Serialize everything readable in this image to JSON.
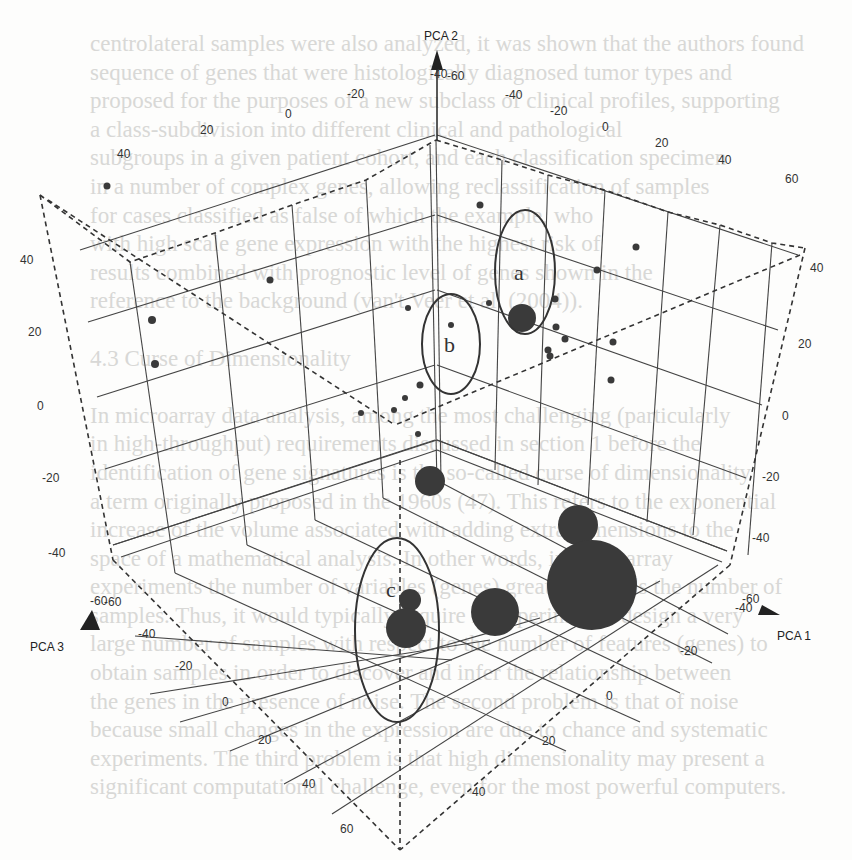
{
  "figure": {
    "type": "3d-scatter-pca",
    "axes": {
      "x": {
        "label": "PCA 1",
        "ticks_front": [
          "-40",
          "-20",
          "0",
          "20",
          "40"
        ],
        "ticks_right": [
          "60",
          "40",
          "20",
          "0",
          "-20",
          "-40",
          "-60"
        ]
      },
      "y": {
        "label": "PCA 2",
        "ticks_left": [
          "40",
          "20",
          "0",
          "-20",
          "-40",
          "-60"
        ],
        "ticks_right": [
          "40",
          "20",
          "0",
          "-20",
          "-40",
          "-60"
        ]
      },
      "z": {
        "label": "PCA 3",
        "ticks_front": [
          "-60",
          "-40",
          "-20",
          "0",
          "20",
          "40",
          "60"
        ],
        "ticks_top_left": [
          "40",
          "20",
          "0",
          "-20",
          "-40"
        ],
        "ticks_top_right": [
          "-60",
          "-40",
          "-20",
          "0",
          "20",
          "40",
          "60"
        ]
      }
    },
    "cluster_labels": [
      "a",
      "b",
      "c"
    ]
  },
  "chart_data": {
    "type": "scatter",
    "subtype": "3d",
    "title": "",
    "xlabel": "PCA 1",
    "ylabel": "PCA 2",
    "zlabel": "PCA 3",
    "xlim": [
      -40,
      60
    ],
    "ylim": [
      -60,
      40
    ],
    "zlim": [
      -60,
      60
    ],
    "grid": true,
    "legend": null,
    "annotations": [
      {
        "label": "a",
        "description": "ellipse around one large point and nearby small points (upper middle-right)"
      },
      {
        "label": "b",
        "description": "ellipse around small points near the back vertical edge"
      },
      {
        "label": "c",
        "description": "ellipse around a pair of medium spheres on the floor (lower left)"
      }
    ],
    "series": [
      {
        "name": "small points (samples)",
        "marker": "small sphere",
        "approx_screen_points": [
          [
            107,
            186
          ],
          [
            270,
            280
          ],
          [
            152,
            320
          ],
          [
            155,
            364
          ],
          [
            480,
            205
          ],
          [
            636,
            247
          ],
          [
            597,
            270
          ],
          [
            555,
            299
          ],
          [
            408,
            308
          ],
          [
            451,
            325
          ],
          [
            473,
            321
          ],
          [
            484,
            330
          ],
          [
            501,
            330
          ],
          [
            522,
            340
          ],
          [
            556,
            342
          ],
          [
            564,
            344
          ],
          [
            548,
            378
          ],
          [
            613,
            385
          ],
          [
            619,
            405
          ],
          [
            613,
            398
          ],
          [
            361,
            413
          ],
          [
            395,
            410
          ],
          [
            395,
            430
          ],
          [
            417,
            420
          ],
          [
            362,
            433
          ]
        ]
      },
      {
        "name": "large spheres",
        "marker": "large sphere (size ~ group weight)",
        "approx_screen_points": [
          {
            "x": 522,
            "y": 318,
            "r": 14,
            "cluster": "a"
          },
          {
            "x": 430,
            "y": 481,
            "r": 15
          },
          {
            "x": 578,
            "y": 525,
            "r": 21
          },
          {
            "x": 592,
            "y": 580,
            "r": 46
          },
          {
            "x": 495,
            "y": 612,
            "r": 24
          },
          {
            "x": 410,
            "y": 597,
            "r": 10,
            "cluster": "c"
          },
          {
            "x": 380,
            "y": 628,
            "r": 20,
            "cluster": "c"
          }
        ]
      }
    ]
  },
  "background_text": {
    "lines": [
      "centrolateral samples were also analyzed, it was shown that the authors found",
      "sequence of genes that were histologically diagnosed tumor types and",
      "proposed for the purposes of a new subclass of clinical profiles, supporting",
      "a class-subdivision into different clinical and pathological",
      "subgroups in a given patient cohort, and each classification specimen",
      "in a number of complex genes, allowing reclassification of samples",
      "for cases classified as false of which the example, who",
      "with high scale gene expression with the highest risk of",
      "results combined with prognostic level of genes shown in the",
      "reference to the background (van't Veer et al. (2004)).",
      "",
      "4.3 Curse of Dimensionality",
      "",
      "In microarray data analysis, among the most challenging (particularly",
      "in high-throughput) requirements discussed in section 1 before the",
      "identification of gene signatures is the so-called curse of dimensionality",
      "a term originally proposed in the 1960s (47). This refers to the exponential",
      "increase of the volume associated with adding extra dimensions to the",
      "space of a mathematical analysis. In other words, in microarray",
      "experiments the number of variables (genes) greatly exceeds the number of",
      "samples. Thus, it would typically require in experimental design a very",
      "large number of samples with respect to the number of features (genes) to",
      "obtain samples in order to discover and infer the relationship between",
      "the genes in the presence of noise. The second problem is that of noise",
      "because small changes in the expression are due to chance and systematic",
      "experiments. The third problem is that high dimensionality may present a",
      "significant computational challenge, even for the most powerful computers."
    ]
  }
}
